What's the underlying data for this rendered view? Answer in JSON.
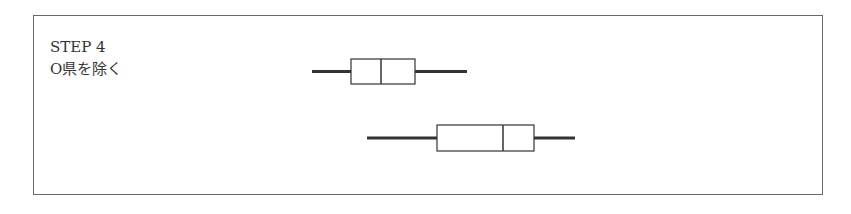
{
  "caption": {
    "step": "STEP 4",
    "description": "O県を除く"
  },
  "colors": {
    "line": "#333333",
    "frame": "#6a6a6a"
  },
  "chart_data": {
    "type": "boxplot",
    "series": [
      {
        "name": "top",
        "whisker_min_px": 312,
        "q1_px": 351,
        "median_px": 381,
        "q3_px": 415,
        "whisker_max_px": 467,
        "y_top": 59,
        "y_bottom": 84
      },
      {
        "name": "bottom",
        "whisker_min_px": 367,
        "q1_px": 437,
        "median_px": 503,
        "q3_px": 534,
        "whisker_max_px": 575,
        "y_top": 125,
        "y_bottom": 151
      }
    ],
    "xlabel": "",
    "ylabel": "",
    "grid": false,
    "axes_visible": false
  }
}
